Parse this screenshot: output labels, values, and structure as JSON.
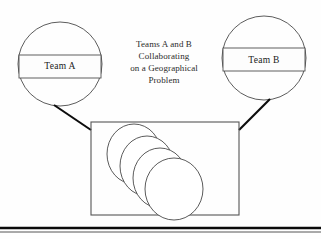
{
  "diagram": {
    "title": "Teams A and B Collaborating on a Geographical Problem",
    "background_color": "#fefefe",
    "stroke_color": "#4a4a4a",
    "connector_color": "#0c0c0c",
    "nodes": [
      {
        "id": "team-a",
        "label": "Team A",
        "shape": "circle",
        "cx": 60,
        "cy": 64,
        "r": 42,
        "box": {
          "x": 19,
          "y": 55,
          "width": 82,
          "height": 23
        }
      },
      {
        "id": "team-b",
        "label": "Team B",
        "shape": "circle",
        "cx": 264,
        "cy": 58,
        "r": 42,
        "box": {
          "x": 223,
          "y": 48,
          "width": 82,
          "height": 23
        }
      }
    ],
    "caption": {
      "lines": [
        "Teams A and B",
        "Collaborating",
        "on a Geographical",
        "Problem"
      ],
      "cx": 164,
      "start_y": 47,
      "line_height": 12
    },
    "container": {
      "id": "shared-workspace",
      "x": 91,
      "y": 122,
      "width": 148,
      "height": 93
    },
    "layers": {
      "count": 4,
      "label": "map-layer-stack",
      "discs": [
        {
          "cx": 134,
          "cy": 154,
          "rx": 27,
          "ry": 30
        },
        {
          "cx": 147,
          "cy": 166,
          "rx": 27,
          "ry": 30
        },
        {
          "cx": 160,
          "cy": 178,
          "rx": 27,
          "ry": 30
        },
        {
          "cx": 174,
          "cy": 189,
          "rx": 29,
          "ry": 31
        }
      ]
    },
    "connectors": [
      {
        "id": "team-a-to-container",
        "x1": 54,
        "y1": 105,
        "x2": 91,
        "y2": 130
      },
      {
        "id": "team-b-to-container",
        "x1": 270,
        "y1": 99,
        "x2": 239,
        "y2": 130
      }
    ],
    "bottom_rule": {
      "thick_y": 228,
      "thin_y": 232,
      "x_start": 0,
      "x_end": 321
    }
  }
}
